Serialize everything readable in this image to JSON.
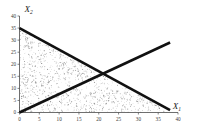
{
  "chart_data": {
    "type": "line",
    "title": "",
    "xlabel": "X1",
    "ylabel": "X2",
    "xlabel_display": "X",
    "xlabel_subscript": "1",
    "ylabel_display": "X",
    "ylabel_subscript": "2",
    "xlim": [
      0,
      40
    ],
    "ylim": [
      0,
      40
    ],
    "xticks": [
      0,
      5,
      10,
      15,
      20,
      25,
      30,
      35,
      40
    ],
    "yticks": [
      0,
      5,
      10,
      15,
      20,
      25,
      30,
      35,
      40
    ],
    "xtick_labels": [
      "0",
      "5",
      "10",
      "15",
      "20",
      "25",
      "30",
      "35",
      "40"
    ],
    "ytick_labels": [
      "0",
      "5",
      "10",
      "15",
      "20",
      "25",
      "30",
      "35",
      "40"
    ],
    "grid": false,
    "legend": null,
    "series": [
      {
        "name": "constraint-descending",
        "type": "line",
        "x": [
          0,
          38
        ],
        "y": [
          35,
          1
        ],
        "color": "#111111",
        "width": 2.6
      },
      {
        "name": "constraint-ascending",
        "type": "line",
        "x": [
          0,
          38
        ],
        "y": [
          0,
          29
        ],
        "color": "#111111",
        "width": 2.6
      }
    ],
    "intersection": {
      "x": 24,
      "y": 20
    },
    "shaded_region": {
      "name": "feasible-region",
      "pattern": "stipple",
      "color": "#6d6d6d",
      "density": 2100,
      "vertices": [
        {
          "x": 0,
          "y": 0
        },
        {
          "x": 0,
          "y": 35
        },
        {
          "x": 38,
          "y": 1
        },
        {
          "x": 38,
          "y": 0
        }
      ]
    }
  },
  "axes": {
    "y_name": "X",
    "y_sub": "2",
    "x_name": "X",
    "x_sub": "1"
  }
}
